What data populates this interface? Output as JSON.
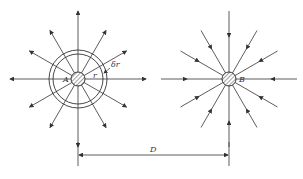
{
  "diagram": {
    "source": {
      "label": "A",
      "cx": 78,
      "cy": 79,
      "core_r": 7,
      "ring_inner_r": 25,
      "ring_outer_r": 29,
      "flow": "outward"
    },
    "sink": {
      "label": "B",
      "cx": 229,
      "cy": 79,
      "core_r": 7,
      "flow": "inward"
    },
    "ring_labels": {
      "radius": "r",
      "thickness": "δr"
    },
    "rays": 12,
    "dimension": {
      "label": "D",
      "y": 152,
      "x1": 78,
      "x2": 229
    },
    "stroke_color": "#333333"
  }
}
